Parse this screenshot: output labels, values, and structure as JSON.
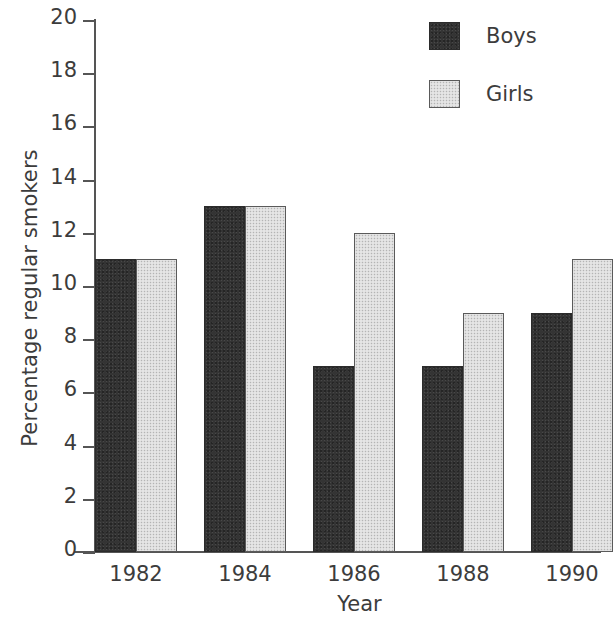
{
  "chart_data": {
    "type": "bar",
    "title": "",
    "subtitle": "",
    "xlabel": "Year",
    "ylabel": "Percentage regular smokers",
    "categories": [
      "1982",
      "1984",
      "1986",
      "1988",
      "1990"
    ],
    "series": [
      {
        "name": "Boys",
        "values": [
          11,
          13,
          7,
          7,
          9
        ],
        "color": "#343434"
      },
      {
        "name": "Girls",
        "values": [
          11,
          13,
          12,
          9,
          11
        ],
        "color": "#dcdcdc"
      }
    ],
    "ylim": [
      0,
      20
    ],
    "ytick_values": [
      20,
      18,
      16,
      14,
      12,
      10,
      8,
      6,
      4,
      2,
      0
    ],
    "ytick_labels": [
      "20",
      "18",
      "16",
      "14",
      "12",
      "10",
      "8",
      "6",
      "4",
      "2",
      "0"
    ],
    "grid": false,
    "legend_position": "top-right",
    "legend_entries": [
      "Boys",
      "Girls"
    ],
    "annotations": []
  },
  "legend": {
    "boys_label": "Boys",
    "girls_label": "Girls"
  },
  "axes": {
    "x_title": "Year",
    "y_title": "Percentage regular smokers"
  }
}
